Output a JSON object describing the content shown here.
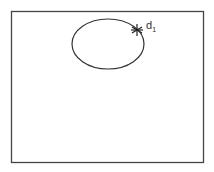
{
  "diagram": {
    "frame": {
      "x": 11,
      "y": 11,
      "width": 192,
      "height": 151,
      "stroke": "#444444"
    },
    "ellipse": {
      "cx": 108,
      "cy": 44,
      "rx": 36,
      "ry": 25,
      "stroke": "#333333"
    },
    "marker": {
      "x": 137,
      "y": 30,
      "type": "asterisk"
    },
    "label": {
      "text": "d",
      "subscript": "1"
    }
  }
}
